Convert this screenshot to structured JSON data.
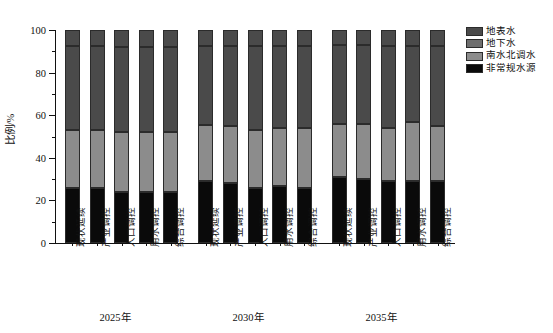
{
  "chart_data": {
    "type": "bar",
    "stacked": true,
    "title": "",
    "xlabel": "",
    "ylabel": "比例/%",
    "ylim": [
      0,
      100
    ],
    "yticks": [
      0,
      20,
      40,
      60,
      80,
      100
    ],
    "ytick_labels": [
      "0",
      "20",
      "40",
      "60",
      "80",
      "100"
    ],
    "grid": false,
    "legend_position": "right-top",
    "group_labels": [
      "2025年",
      "2030年",
      "2035年"
    ],
    "categories": [
      "现状延续",
      "产业调控",
      "人口调控",
      "用水调控",
      "综合调控",
      "现状延续",
      "产业调控",
      "人口调控",
      "用水调控",
      "综合调控",
      "现状延续",
      "产业调控",
      "人口调控",
      "用水调控",
      "综合调控"
    ],
    "series": [
      {
        "name": "非常规水源",
        "color": "#0a0a0a",
        "values": [
          26,
          26,
          24,
          24,
          24,
          29,
          28,
          26,
          27,
          26,
          31,
          30,
          29,
          29,
          29
        ]
      },
      {
        "name": "南水北调水",
        "color": "#8c8c8c",
        "values": [
          27,
          27,
          28,
          28,
          28,
          26.5,
          27,
          27,
          27,
          28,
          25,
          26,
          25,
          28,
          26
        ]
      },
      {
        "name": "地下水",
        "color": "#4a4a4a",
        "values": [
          39.5,
          39.5,
          40,
          40,
          40,
          37,
          37.5,
          39.5,
          38.5,
          38.5,
          37,
          37,
          38.5,
          35.5,
          37.5
        ]
      },
      {
        "name": "地表水",
        "color": "#4a4a4a",
        "values": [
          7.5,
          7.5,
          8,
          8,
          8,
          7.5,
          7.5,
          7.5,
          7.5,
          7.5,
          7,
          7,
          7.5,
          7.5,
          7.5
        ]
      }
    ],
    "boundaries_note": "cumulative tops: black top, then +南水北调水 = mid line, then +地下水 = upper line near 92.5, top = 100"
  },
  "legend": {
    "items": [
      {
        "label": "地表水",
        "color": "#4a4a4a"
      },
      {
        "label": "地下水",
        "color": "#6e6e6e"
      },
      {
        "label": "南水北调水",
        "color": "#8c8c8c"
      },
      {
        "label": "非常规水源",
        "color": "#0a0a0a"
      }
    ]
  },
  "axes": {
    "y_title": "比例/%",
    "y_labels": [
      "100",
      "80",
      "60",
      "40",
      "20",
      "0"
    ]
  }
}
